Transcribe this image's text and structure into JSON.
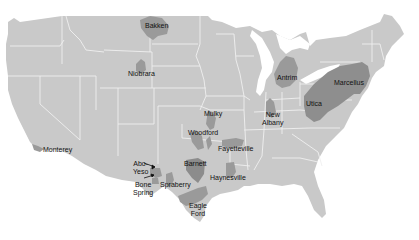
{
  "map": {
    "title": "",
    "colors": {
      "land": "#c9c9c9",
      "border": "#eeeeee",
      "shale": "#9a9a9a",
      "shale_dark": "#8c8c8c",
      "background": "#ffffff",
      "label": "#111111"
    },
    "plays": [
      {
        "id": "bakken",
        "label": "Bakken"
      },
      {
        "id": "niobrara",
        "label": "Niobrara"
      },
      {
        "id": "antrim",
        "label": "Antrim"
      },
      {
        "id": "marcellus",
        "label": "Marcellus"
      },
      {
        "id": "utica",
        "label": "Utica"
      },
      {
        "id": "new-albany",
        "label_line1": "New",
        "label_line2": "Albany"
      },
      {
        "id": "mulky",
        "label": "Mulky"
      },
      {
        "id": "woodford",
        "label": "Woodford"
      },
      {
        "id": "fayetteville",
        "label": "Fayetteville"
      },
      {
        "id": "barnett",
        "label": "Barnett"
      },
      {
        "id": "haynesville",
        "label": "Haynesville"
      },
      {
        "id": "monterey",
        "label": "Monterey"
      },
      {
        "id": "abo-yeso",
        "label_line1": "Abo-",
        "label_line2": "Yeso"
      },
      {
        "id": "bone-spring",
        "label_line1": "Bone",
        "label_line2": "Spring"
      },
      {
        "id": "spraberry",
        "label": "Spraberry"
      },
      {
        "id": "eagle-ford",
        "label_line1": "Eagle",
        "label_line2": "Ford"
      }
    ]
  }
}
